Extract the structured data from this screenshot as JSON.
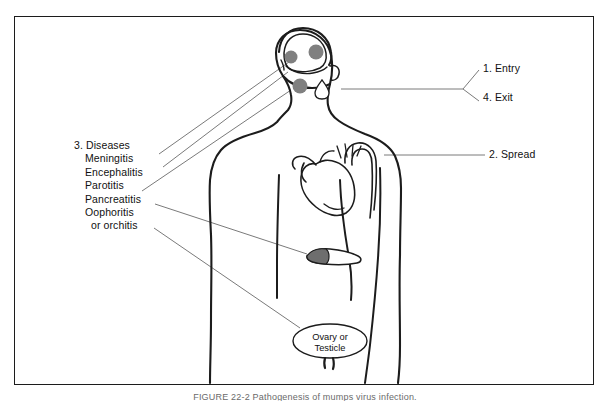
{
  "figure": {
    "caption": "FIGURE 22-2  Pathogenesis of mumps virus infection."
  },
  "labels": {
    "entry": "1. Entry",
    "spread": "2. Spread",
    "exit": "4. Exit",
    "diseases_heading": "3. Diseases",
    "diseases": [
      "Meningitis",
      "Encephalitis",
      "Parotitis",
      "Pancreatitis",
      "Oophoritis",
      "or orchitis"
    ]
  },
  "organs": {
    "gonad_line1": "Ovary or",
    "gonad_line2": "Testicle"
  },
  "colors": {
    "ink": "#1c1c1c",
    "lesion_gray": "#808080",
    "leader_gray": "#7a7a7a",
    "frame": "#1c1c1c",
    "background": "#ffffff"
  }
}
